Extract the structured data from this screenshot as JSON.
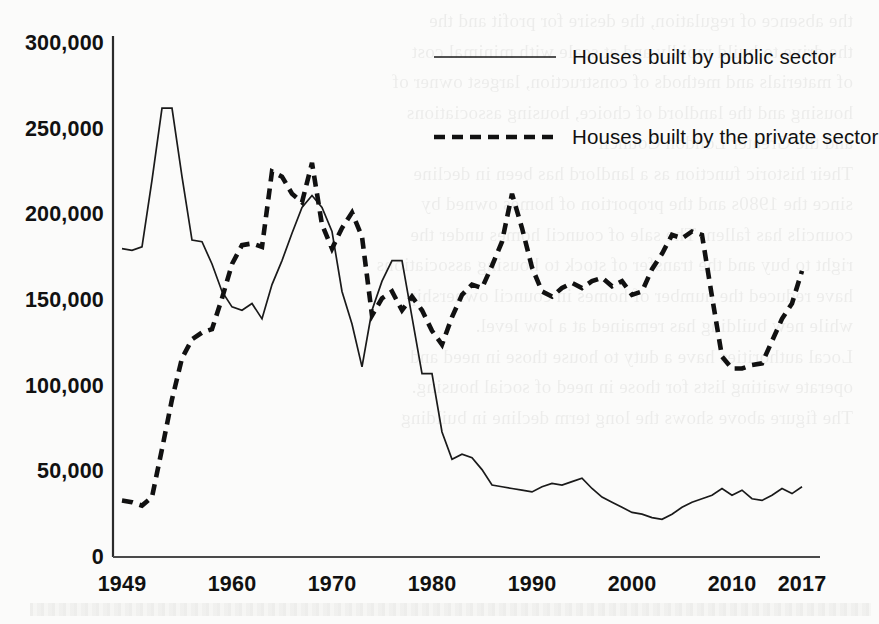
{
  "chart_data": {
    "type": "line",
    "title": "",
    "xlabel": "",
    "ylabel": "",
    "xlim": [
      1949,
      2017
    ],
    "ylim": [
      0,
      300000
    ],
    "grid": false,
    "legend_position": "top-right",
    "xticks": [
      "1949",
      "1960",
      "1970",
      "1980",
      "1990",
      "2000",
      "2010",
      "2017"
    ],
    "xtick_values": [
      1949,
      1960,
      1970,
      1980,
      1990,
      2000,
      2010,
      2017
    ],
    "yticks": [
      "0",
      "50,000",
      "100,000",
      "150,000",
      "200,000",
      "250,000",
      "300,000"
    ],
    "ytick_values": [
      0,
      50000,
      100000,
      150000,
      200000,
      250000,
      300000
    ],
    "x": [
      1949,
      1950,
      1951,
      1952,
      1953,
      1954,
      1955,
      1956,
      1957,
      1958,
      1959,
      1960,
      1961,
      1962,
      1963,
      1964,
      1965,
      1966,
      1967,
      1968,
      1969,
      1970,
      1971,
      1972,
      1973,
      1974,
      1975,
      1976,
      1977,
      1978,
      1979,
      1980,
      1981,
      1982,
      1983,
      1984,
      1985,
      1986,
      1987,
      1988,
      1989,
      1990,
      1991,
      1992,
      1993,
      1994,
      1995,
      1996,
      1997,
      1998,
      1999,
      2000,
      2001,
      2002,
      2003,
      2004,
      2005,
      2006,
      2007,
      2008,
      2009,
      2010,
      2011,
      2012,
      2013,
      2014,
      2015,
      2016,
      2017
    ],
    "series": [
      {
        "name": "Houses built by public sector",
        "style": "solid",
        "color": "#1a1a1a",
        "values": [
          180000,
          179000,
          181000,
          220000,
          262000,
          262000,
          222000,
          185000,
          184000,
          171000,
          155000,
          146000,
          144000,
          148000,
          139000,
          159000,
          173000,
          189000,
          204000,
          211000,
          204000,
          190000,
          155000,
          136000,
          111000,
          144000,
          161000,
          173000,
          173000,
          140000,
          107000,
          107000,
          73000,
          57000,
          60000,
          58000,
          51000,
          42000,
          41000,
          40000,
          39000,
          38000,
          41000,
          43000,
          42000,
          44000,
          46000,
          40000,
          35000,
          32000,
          29000,
          26000,
          25000,
          23000,
          22000,
          25000,
          29000,
          32000,
          34000,
          36000,
          40000,
          36000,
          39000,
          34000,
          33000,
          36000,
          40000,
          37000,
          41000
        ]
      },
      {
        "name": "Houses built by the private sector",
        "style": "dashed",
        "color": "#111111",
        "values": [
          33000,
          32000,
          30000,
          35000,
          63000,
          92000,
          116000,
          127000,
          131000,
          133000,
          151000,
          171000,
          182000,
          183000,
          181000,
          225000,
          222000,
          212000,
          207000,
          230000,
          194000,
          180000,
          192000,
          201000,
          187000,
          141000,
          151000,
          155000,
          144000,
          152000,
          144000,
          132000,
          124000,
          140000,
          153000,
          159000,
          157000,
          170000,
          184000,
          212000,
          192000,
          169000,
          155000,
          152000,
          157000,
          160000,
          157000,
          161000,
          163000,
          158000,
          161000,
          153000,
          155000,
          168000,
          177000,
          188000,
          186000,
          190000,
          188000,
          152000,
          117000,
          110000,
          110000,
          112000,
          113000,
          126000,
          139000,
          148000,
          167000
        ]
      }
    ]
  },
  "axis": {
    "y_labels": [
      "300,000",
      "250,000",
      "200,000",
      "150,000",
      "100,000",
      "50,000",
      "0"
    ],
    "x_labels": [
      "1949",
      "1960",
      "1970",
      "1980",
      "1990",
      "2000",
      "2010",
      "2017"
    ]
  },
  "legend": {
    "items": [
      {
        "label": "Houses built by public sector",
        "style": "solid"
      },
      {
        "label": "Houses built by the private sector",
        "style": "dashed"
      }
    ]
  },
  "bleed_text": [
    "the absence of regulation, the desire for profit and the",
    "the drive to build rapidly and at scale with minimal cost",
    "of materials and methods of construction, largest owner of",
    "housing and the landlord of choice, housing associations",
    "and the Greater London Council",
    "",
    "Their historic function as a landlord has been in decline",
    "since the 1980s and the proportion of homes owned by",
    "councils has fallen. The sale of council homes under the",
    "right to buy and the transfer of stock to housing associations",
    "have reduced the number of homes in council ownership",
    "while new building has remained at a low level.",
    "",
    "Local authorities have a duty to house those in need and",
    "operate waiting lists for those in need of social housing.",
    "",
    "The figure above shows the long term decline in building"
  ]
}
